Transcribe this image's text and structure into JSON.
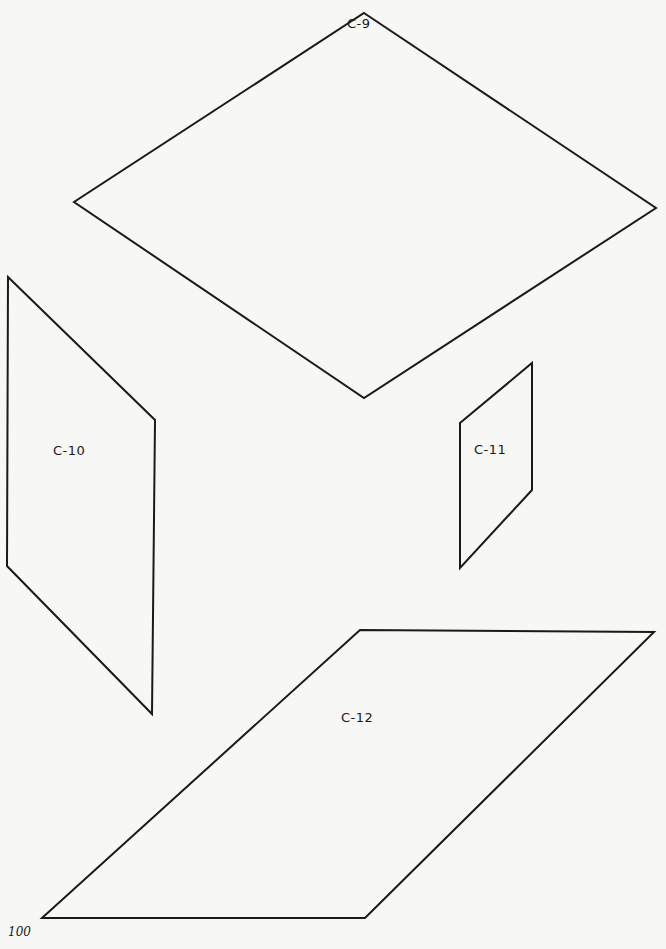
{
  "shapes": [
    {
      "id": "C-9",
      "label": "C-9",
      "points": "364,13 656,208 364,398 74,202",
      "label_pos": [
        347,
        18
      ]
    },
    {
      "id": "C-10",
      "label": "C-10",
      "points": "8,277 155,420 152,714 7,566",
      "label_pos": [
        53,
        444
      ]
    },
    {
      "id": "C-11",
      "label": "C-11",
      "points": "532,363 532,490 460,568 460,423",
      "label_pos": [
        474,
        443
      ]
    },
    {
      "id": "C-12",
      "label": "C-12",
      "points": "360,630 654,632 365,918 42,918",
      "label_pos": [
        341,
        712
      ]
    }
  ],
  "stroke_color": "#1a1a1a",
  "page_number": "100"
}
